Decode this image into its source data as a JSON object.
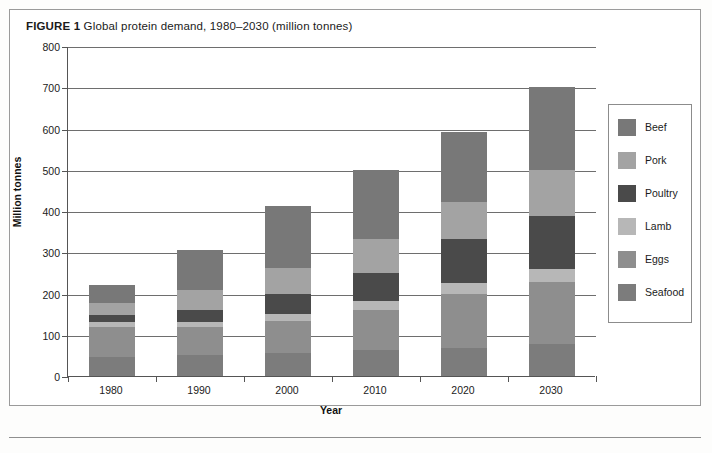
{
  "figure": {
    "number_label": "FIGURE 1",
    "title": "Global protein demand, 1980–2030 (million tonnes)"
  },
  "chart_data": {
    "type": "bar",
    "subtype": "stacked-vertical",
    "title": "Global protein demand, 1980–2030 (million tonnes)",
    "xlabel": "Year",
    "ylabel": "Million tonnes",
    "categories": [
      "1980",
      "1990",
      "2000",
      "2010",
      "2020",
      "2030"
    ],
    "ylim": [
      0,
      800
    ],
    "yticks": [
      0,
      100,
      200,
      300,
      400,
      500,
      600,
      700,
      800
    ],
    "ytick_labels": [
      "0",
      "100",
      "200",
      "300",
      "400",
      "500",
      "600",
      "700",
      "800"
    ],
    "grid": "horizontal",
    "legend_position": "right-outside",
    "stack_order_bottom_to_top": [
      "Seafood",
      "Eggs",
      "Lamb",
      "Poultry",
      "Pork",
      "Beef"
    ],
    "series": [
      {
        "name": "Seafood",
        "color": "#7c7c7c",
        "values": [
          45,
          50,
          55,
          62,
          68,
          78
        ]
      },
      {
        "name": "Eggs",
        "color": "#8e8e8e",
        "values": [
          75,
          70,
          78,
          98,
          130,
          150
        ]
      },
      {
        "name": "Lamb",
        "color": "#b7b7b7",
        "values": [
          10,
          12,
          18,
          22,
          28,
          32
        ]
      },
      {
        "name": "Poultry",
        "color": "#4a4a4a",
        "values": [
          18,
          28,
          48,
          68,
          105,
          128
        ]
      },
      {
        "name": "Pork",
        "color": "#a3a3a3",
        "values": [
          28,
          48,
          62,
          82,
          92,
          112
        ]
      },
      {
        "name": "Beef",
        "color": "#787878",
        "values": [
          45,
          97,
          152,
          168,
          169,
          200
        ]
      }
    ],
    "totals": [
      221,
      305,
      413,
      500,
      592,
      700
    ]
  },
  "legend": {
    "items": [
      {
        "label": "Beef",
        "color": "#787878"
      },
      {
        "label": "Pork",
        "color": "#a3a3a3"
      },
      {
        "label": "Poultry",
        "color": "#4a4a4a"
      },
      {
        "label": "Lamb",
        "color": "#b7b7b7"
      },
      {
        "label": "Eggs",
        "color": "#8e8e8e"
      },
      {
        "label": "Seafood",
        "color": "#7c7c7c"
      }
    ]
  }
}
